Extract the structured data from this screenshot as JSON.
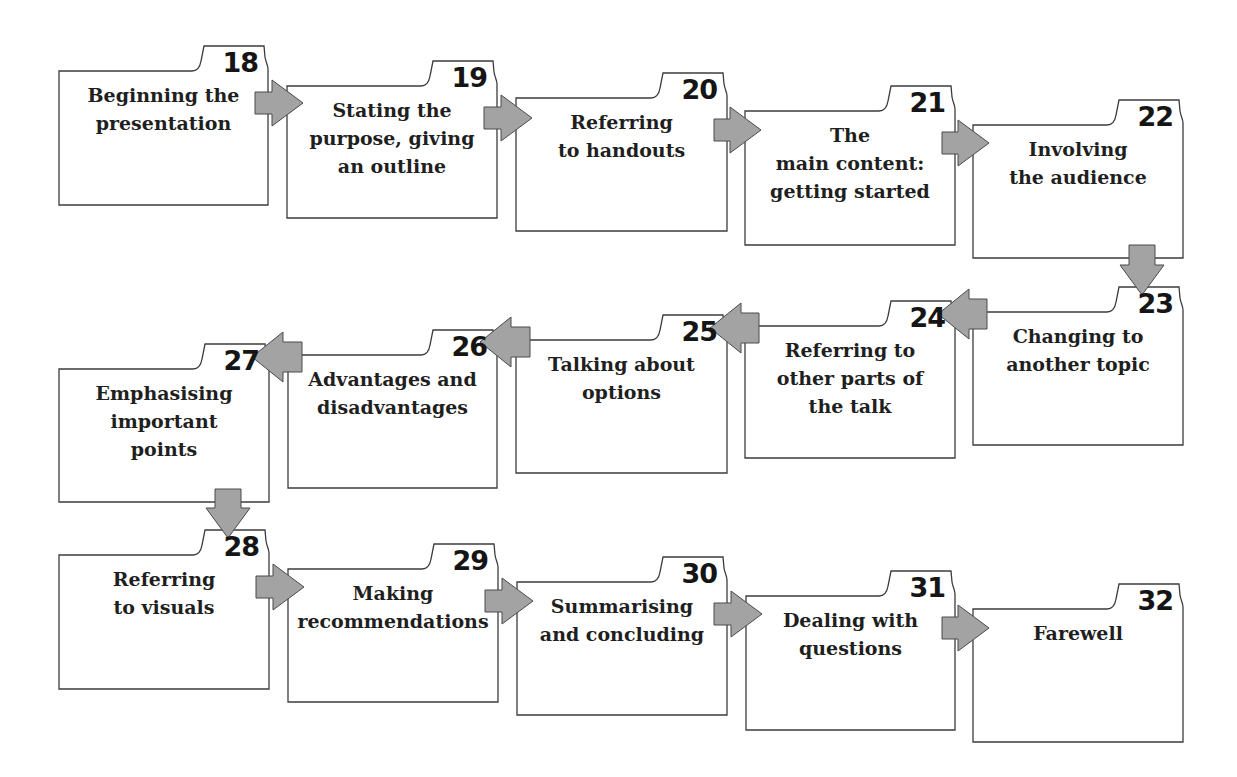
{
  "diagram": {
    "type": "flow",
    "colors": {
      "box_border": "#3c3c3c",
      "box_fill": "#ffffff",
      "arrow_fill": "#a3a3a3",
      "arrow_border": "#4a4a4a",
      "text": "#1f1f1f"
    },
    "steps": [
      {
        "number": "18",
        "label": "Beginning the\npresentation",
        "x": 59,
        "y": 71,
        "w": 209,
        "h": 134
      },
      {
        "number": "19",
        "label": "Stating the\npurpose, giving\nan outline",
        "x": 287,
        "y": 86,
        "w": 210,
        "h": 132
      },
      {
        "number": "20",
        "label": "Referring\nto handouts",
        "x": 516,
        "y": 98,
        "w": 211,
        "h": 133
      },
      {
        "number": "21",
        "label": "The\nmain content:\ngetting started",
        "x": 745,
        "y": 111,
        "w": 210,
        "h": 134
      },
      {
        "number": "22",
        "label": "Involving\nthe audience",
        "x": 973,
        "y": 125,
        "w": 210,
        "h": 133
      },
      {
        "number": "23",
        "label": "Changing to\nanother topic",
        "x": 973,
        "y": 312,
        "w": 210,
        "h": 133
      },
      {
        "number": "24",
        "label": "Referring to\nother parts of\nthe talk",
        "x": 745,
        "y": 326,
        "w": 210,
        "h": 132
      },
      {
        "number": "25",
        "label": "Talking about\noptions",
        "x": 516,
        "y": 340,
        "w": 211,
        "h": 133
      },
      {
        "number": "26",
        "label": "Advantages and\ndisadvantages",
        "x": 288,
        "y": 355,
        "w": 209,
        "h": 133
      },
      {
        "number": "27",
        "label": "Emphasising\nimportant\npoints",
        "x": 59,
        "y": 369,
        "w": 210,
        "h": 133
      },
      {
        "number": "28",
        "label": "Referring\nto visuals",
        "x": 59,
        "y": 555,
        "w": 210,
        "h": 134
      },
      {
        "number": "29",
        "label": "Making\nrecommendations",
        "x": 288,
        "y": 569,
        "w": 210,
        "h": 133
      },
      {
        "number": "30",
        "label": "Summarising\nand concluding",
        "x": 517,
        "y": 582,
        "w": 210,
        "h": 133
      },
      {
        "number": "31",
        "label": "Dealing with\nquestions",
        "x": 746,
        "y": 596,
        "w": 209,
        "h": 134
      },
      {
        "number": "32",
        "label": "Farewell",
        "x": 973,
        "y": 609,
        "w": 210,
        "h": 133
      }
    ],
    "connections": [
      {
        "from": "18",
        "to": "19",
        "direction": "right"
      },
      {
        "from": "19",
        "to": "20",
        "direction": "right"
      },
      {
        "from": "20",
        "to": "21",
        "direction": "right"
      },
      {
        "from": "21",
        "to": "22",
        "direction": "right"
      },
      {
        "from": "22",
        "to": "23",
        "direction": "down"
      },
      {
        "from": "23",
        "to": "24",
        "direction": "left"
      },
      {
        "from": "24",
        "to": "25",
        "direction": "left"
      },
      {
        "from": "25",
        "to": "26",
        "direction": "left"
      },
      {
        "from": "26",
        "to": "27",
        "direction": "left"
      },
      {
        "from": "27",
        "to": "28",
        "direction": "down"
      },
      {
        "from": "28",
        "to": "29",
        "direction": "right"
      },
      {
        "from": "29",
        "to": "30",
        "direction": "right"
      },
      {
        "from": "30",
        "to": "31",
        "direction": "right"
      },
      {
        "from": "31",
        "to": "32",
        "direction": "right"
      }
    ]
  }
}
